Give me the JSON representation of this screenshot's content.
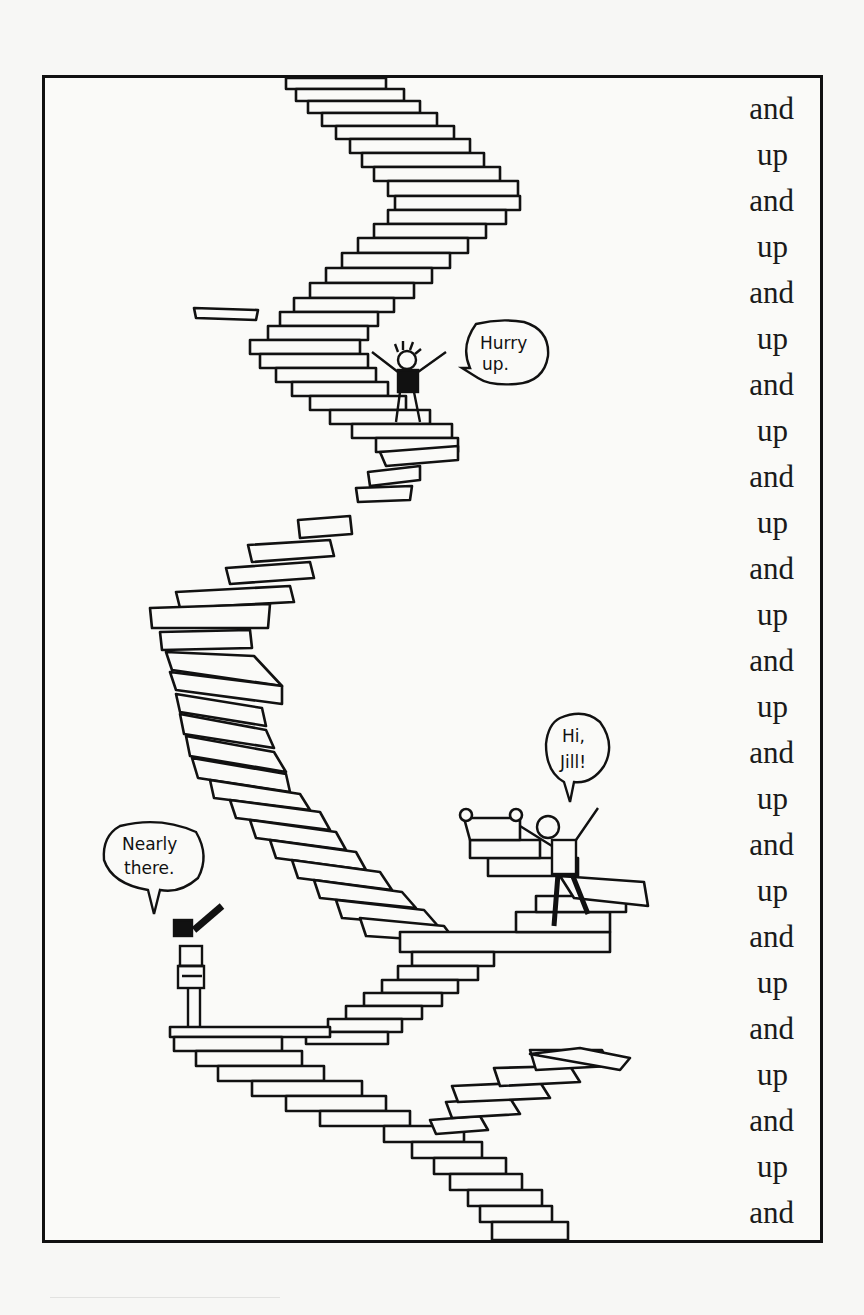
{
  "illustration": {
    "title": "Endless staircase",
    "characters": [
      {
        "name": "top-climber",
        "speech": [
          "Hurry",
          "up."
        ]
      },
      {
        "name": "jill",
        "speech": [
          "Hi,",
          "Jill!"
        ]
      },
      {
        "name": "telescope-kid",
        "speech": [
          "Nearly",
          "there."
        ]
      }
    ]
  },
  "side_text": {
    "lines": [
      "and",
      "up",
      "and",
      "up",
      "and",
      "up",
      "and",
      "up",
      "and",
      "up",
      "and",
      "up",
      "and",
      "up",
      "and",
      "up",
      "and",
      "up",
      "and",
      "up",
      "and",
      "up",
      "and",
      "up",
      "and"
    ]
  },
  "colors": {
    "ink": "#111111",
    "paper": "#f7f7f5",
    "speckle": "#555555"
  }
}
